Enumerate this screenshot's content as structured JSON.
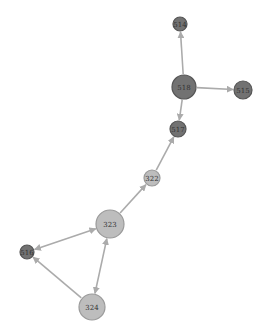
{
  "diagram": {
    "type": "directed-network",
    "colors": {
      "background": "#ffffff",
      "edge": "#ababab",
      "dark_node_fill": "#727272",
      "dark_node_stroke": "#555555",
      "light_node_fill": "#bdbdbd",
      "light_node_stroke": "#9a9a9a"
    },
    "nodes": [
      {
        "id": "514",
        "label": "514",
        "x": 180,
        "y": 24,
        "r": 7,
        "tone": "dark"
      },
      {
        "id": "518",
        "label": "518",
        "x": 184,
        "y": 87,
        "r": 12,
        "tone": "dark"
      },
      {
        "id": "515",
        "label": "515",
        "x": 243,
        "y": 90,
        "r": 9,
        "tone": "dark"
      },
      {
        "id": "517",
        "label": "517",
        "x": 178,
        "y": 129,
        "r": 8,
        "tone": "dark"
      },
      {
        "id": "322",
        "label": "322",
        "x": 152,
        "y": 178,
        "r": 8,
        "tone": "light"
      },
      {
        "id": "323",
        "label": "323",
        "x": 110,
        "y": 224,
        "r": 14,
        "tone": "light"
      },
      {
        "id": "516",
        "label": "516",
        "x": 27,
        "y": 252,
        "r": 7,
        "tone": "dark"
      },
      {
        "id": "324",
        "label": "324",
        "x": 92,
        "y": 307,
        "r": 13,
        "tone": "light"
      }
    ],
    "edges": [
      {
        "from": "518",
        "to": "514",
        "both": false
      },
      {
        "from": "518",
        "to": "515",
        "both": false
      },
      {
        "from": "518",
        "to": "517",
        "both": false
      },
      {
        "from": "322",
        "to": "517",
        "both": false
      },
      {
        "from": "323",
        "to": "322",
        "both": false
      },
      {
        "from": "323",
        "to": "516",
        "both": true
      },
      {
        "from": "323",
        "to": "324",
        "both": true
      },
      {
        "from": "324",
        "to": "516",
        "both": false
      }
    ]
  }
}
